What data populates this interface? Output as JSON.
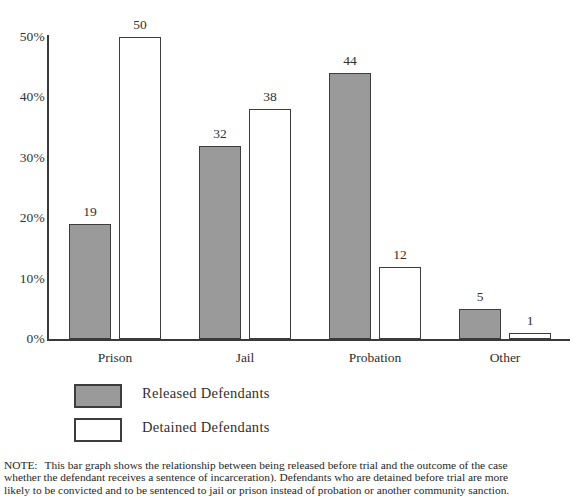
{
  "chart_data": {
    "type": "bar",
    "title": "",
    "subtitle": "",
    "xlabel": "",
    "ylabel": "",
    "ylim": [
      0,
      50
    ],
    "grid": false,
    "legend_position": "below-left",
    "categories": [
      "Prison",
      "Jail",
      "Probation",
      "Other"
    ],
    "y_ticks": [
      0,
      10,
      20,
      30,
      40,
      50
    ],
    "y_tick_labels": [
      "0%",
      "10%",
      "20%",
      "30%",
      "40%",
      "50%"
    ],
    "series": [
      {
        "name": "Released Defendants",
        "color": "#9a9a9a",
        "values": [
          19,
          32,
          44,
          5
        ],
        "value_labels": [
          "19",
          "32",
          "44",
          "5"
        ]
      },
      {
        "name": "Detained Defendants",
        "color": "#ffffff",
        "values": [
          50,
          38,
          12,
          1
        ],
        "value_labels": [
          "50",
          "38",
          "12",
          "1"
        ]
      }
    ]
  },
  "legend": {
    "items": [
      {
        "label": "Released Defendants",
        "swatch": "released"
      },
      {
        "label": "Detained Defendants",
        "swatch": "detained"
      }
    ]
  },
  "note": {
    "label": "NOTE:",
    "lines": [
      "This bar graph shows the relationship between being released before trial and the outcome of the case",
      "whether the defendant receives a sentence of incarceration). Defendants who are detained before trial are more",
      "likely to be convicted and to be sentenced to jail or prison instead of probation or another community sanction."
    ]
  },
  "colors": {
    "released_fill": "#9a9a9a",
    "detained_fill": "#ffffff",
    "bar_border": "#3d3d3d",
    "axis": "#3a3a3a",
    "text": "#2f2f2f"
  }
}
